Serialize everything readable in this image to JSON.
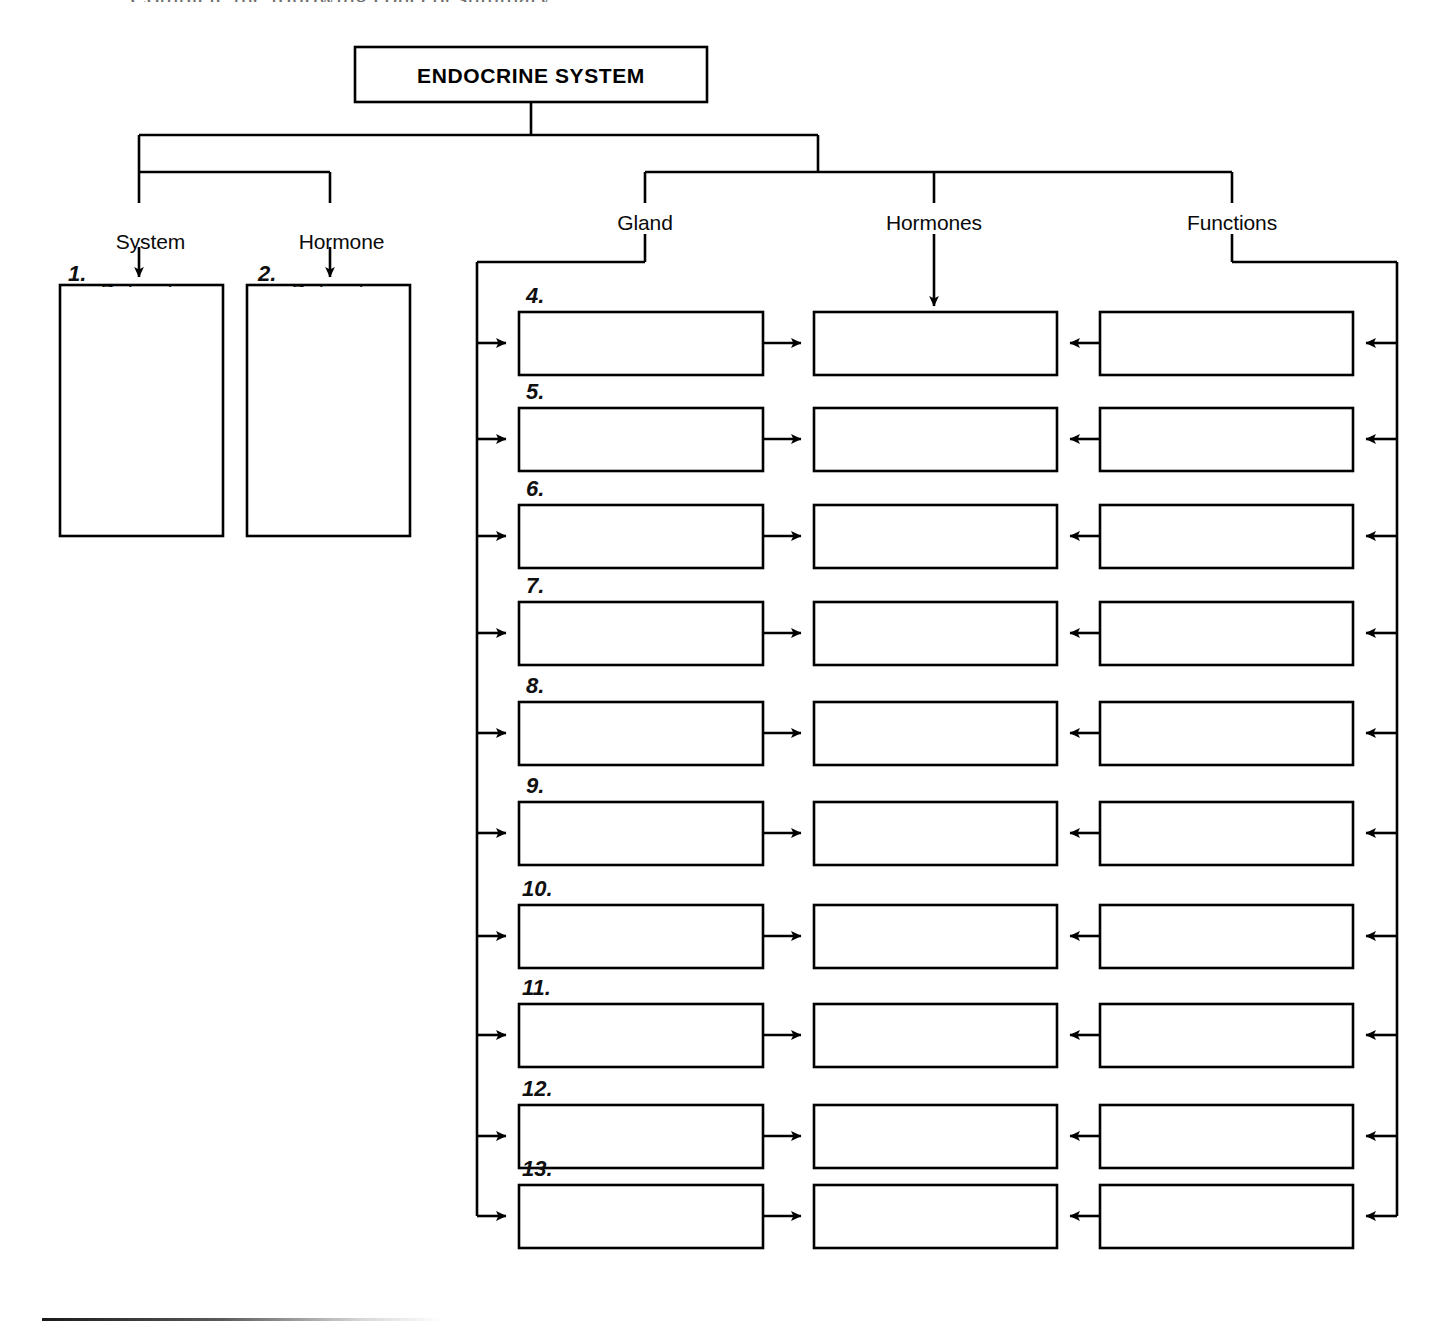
{
  "page": {
    "width": 1449,
    "height": 1329,
    "background": "#ffffff",
    "ink": "#000000",
    "top_cut_text": "Complete the following concept summary."
  },
  "title": {
    "text": "ENDOCRINE SYSTEM"
  },
  "branches": [
    {
      "id": "system-defined-as",
      "line1": "System",
      "line2": "Defined as"
    },
    {
      "id": "hormone-defined-as",
      "line1": "Hormone",
      "line2": "Defined as"
    }
  ],
  "columns": [
    {
      "id": "gland",
      "label": "Gland"
    },
    {
      "id": "hormones",
      "label": "Hormones"
    },
    {
      "id": "functions",
      "label": "Functions"
    }
  ],
  "definition_blanks": [
    {
      "number": "1."
    },
    {
      "number": "2."
    }
  ],
  "rows": [
    {
      "number": "4.",
      "gland": "",
      "hormone": "",
      "function": ""
    },
    {
      "number": "5.",
      "gland": "",
      "hormone": "",
      "function": ""
    },
    {
      "number": "6.",
      "gland": "",
      "hormone": "",
      "function": ""
    },
    {
      "number": "7.",
      "gland": "",
      "hormone": "",
      "function": ""
    },
    {
      "number": "8.",
      "gland": "",
      "hormone": "",
      "function": ""
    },
    {
      "number": "9.",
      "gland": "",
      "hormone": "",
      "function": ""
    },
    {
      "number": "10.",
      "gland": "",
      "hormone": "",
      "function": ""
    },
    {
      "number": "11.",
      "gland": "",
      "hormone": "",
      "function": ""
    },
    {
      "number": "12.",
      "gland": "",
      "hormone": "",
      "function": ""
    },
    {
      "number": "13.",
      "gland": "",
      "hormone": "",
      "function": ""
    }
  ],
  "hidden_numbers_note": "3."
}
